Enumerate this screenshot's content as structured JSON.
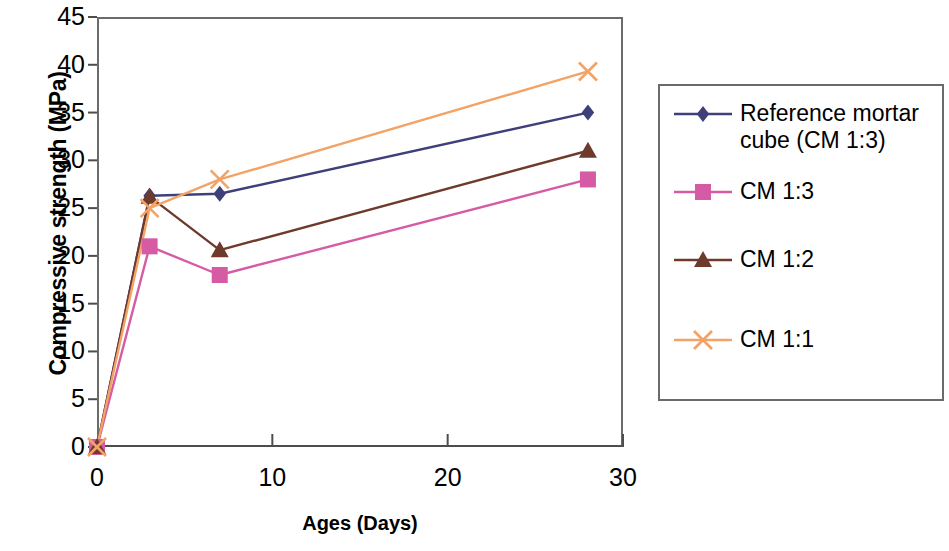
{
  "chart_data": {
    "type": "line",
    "title": "",
    "xlabel": "Ages (Days)",
    "ylabel": "Compressive strength (MPa)",
    "xlim": [
      0,
      30
    ],
    "ylim": [
      0,
      45
    ],
    "xticks": [
      0,
      10,
      20,
      30
    ],
    "yticks": [
      0,
      5,
      10,
      15,
      20,
      25,
      30,
      35,
      40,
      45
    ],
    "x": [
      0,
      3,
      7,
      28
    ],
    "grid": false,
    "legend_position": "right",
    "series": [
      {
        "name": "Reference mortar\ncube (CM 1:3)",
        "marker": "diamond",
        "color": "#3f3f7a",
        "values": [
          0,
          26.3,
          26.5,
          35.0
        ]
      },
      {
        "name": "CM 1:3",
        "marker": "square",
        "color": "#d65ba5",
        "values": [
          0,
          21.0,
          18.0,
          28.0
        ]
      },
      {
        "name": "CM 1:2",
        "marker": "triangle",
        "color": "#6e3a2c",
        "values": [
          0,
          26.2,
          20.6,
          31.0
        ]
      },
      {
        "name": "CM 1:1",
        "marker": "cross",
        "color": "#f2a365",
        "values": [
          0,
          25.0,
          28.0,
          39.3
        ]
      }
    ]
  },
  "axes": {
    "y_tick_labels": [
      "45",
      "40",
      "35",
      "30",
      "25",
      "20",
      "15",
      "10",
      "5",
      "0"
    ],
    "x_tick_labels": [
      "0",
      "10",
      "20",
      "30"
    ],
    "y_title": "Compressive strength (MPa)",
    "x_title": "Ages (Days)"
  },
  "legend": {
    "entries": [
      {
        "label": "Reference mortar\ncube (CM 1:3)",
        "color": "#3f3f7a",
        "marker": "diamond"
      },
      {
        "label": "CM 1:3",
        "color": "#d65ba5",
        "marker": "square"
      },
      {
        "label": "CM 1:2",
        "color": "#6e3a2c",
        "marker": "triangle"
      },
      {
        "label": "CM 1:1",
        "color": "#f2a365",
        "marker": "cross"
      }
    ]
  }
}
